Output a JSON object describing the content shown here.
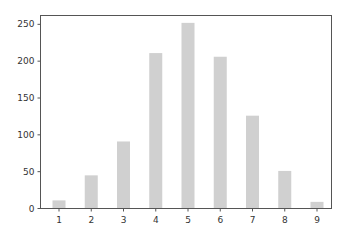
{
  "chart_data": {
    "type": "bar",
    "title": "",
    "xlabel": "",
    "ylabel": "",
    "categories": [
      "1",
      "2",
      "3",
      "4",
      "5",
      "6",
      "7",
      "8",
      "9"
    ],
    "values": [
      11,
      45,
      91,
      211,
      252,
      206,
      126,
      51,
      9
    ],
    "ylim": [
      0,
      262
    ],
    "yticks": [
      0,
      50,
      100,
      150,
      200,
      250
    ],
    "grid": false,
    "legend": null,
    "bar_color": "#d0d0d0"
  }
}
